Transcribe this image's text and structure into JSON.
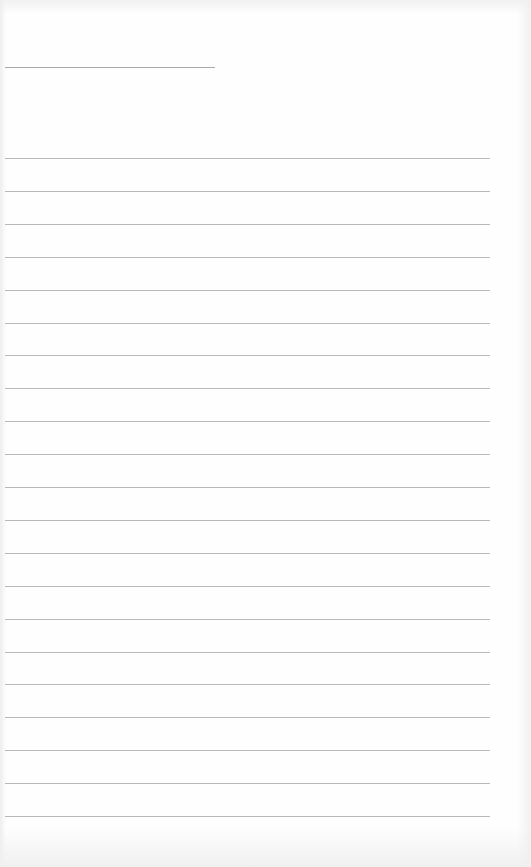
{
  "page": {
    "type": "lined-writing-sheet",
    "background_color": "#fefefe",
    "line_color": "#b9b9b9",
    "header_line": {
      "x": 5,
      "y": 67,
      "width": 210
    },
    "ruled_lines": {
      "count": 21,
      "start_y": 158,
      "spacing": 32.9,
      "x": 5,
      "width": 485
    },
    "faint_bleed_through_text": ""
  }
}
